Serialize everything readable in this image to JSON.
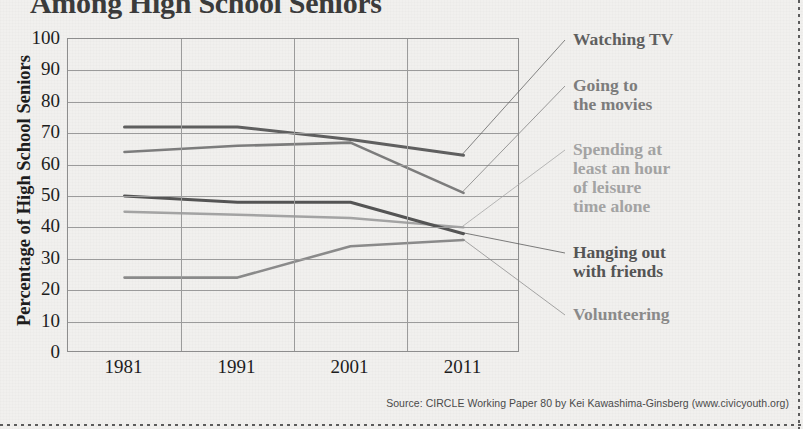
{
  "title": "Among High School Seniors",
  "source": "Source: CIRCLE Working Paper 80 by Kei Kawashima-Ginsberg (www.civicyouth.org)",
  "axes": {
    "ylabel": "Percentage of High School Seniors",
    "yticks": [
      "100",
      "90",
      "80",
      "70",
      "60",
      "50",
      "40",
      "30",
      "20",
      "10",
      "0"
    ],
    "xticks": [
      "1981",
      "1991",
      "2001",
      "2011"
    ]
  },
  "legend": [
    {
      "label": "Watching TV",
      "color": "#5f5f5f"
    },
    {
      "label": "Going to\nthe movies",
      "color": "#7c7c7c"
    },
    {
      "label": "Spending at\nleast an hour\nof leisure\ntime alone",
      "color": "#a3a3a3"
    },
    {
      "label": "Hanging out\nwith friends",
      "color": "#545454"
    },
    {
      "label": "Volunteering",
      "color": "#8a8a8a"
    }
  ],
  "chart_data": {
    "type": "line",
    "title": "Among High School Seniors",
    "xlabel": "",
    "ylabel": "Percentage of High School Seniors",
    "x": [
      1981,
      1991,
      2001,
      2011
    ],
    "categories": [
      "1981",
      "1991",
      "2001",
      "2011"
    ],
    "ylim": [
      0,
      100
    ],
    "ytick_step": 10,
    "grid": "horizontal-and-vertical",
    "legend_position": "right-annotations-with-leader-lines",
    "series": [
      {
        "name": "Watching TV",
        "values": [
          72,
          72,
          68,
          63
        ],
        "color": "#5f5f5f",
        "width": 3.0
      },
      {
        "name": "Going to the movies",
        "values": [
          64,
          66,
          67,
          51
        ],
        "color": "#7c7c7c",
        "width": 2.6
      },
      {
        "name": "Spending at least an hour of leisure time alone",
        "values": [
          45,
          44,
          43,
          40
        ],
        "color": "#a3a3a3",
        "width": 2.4
      },
      {
        "name": "Hanging out with friends",
        "values": [
          50,
          48,
          48,
          38
        ],
        "color": "#545454",
        "width": 3.0
      },
      {
        "name": "Volunteering",
        "values": [
          24,
          24,
          34,
          36
        ],
        "color": "#8a8a8a",
        "width": 2.6
      }
    ]
  }
}
